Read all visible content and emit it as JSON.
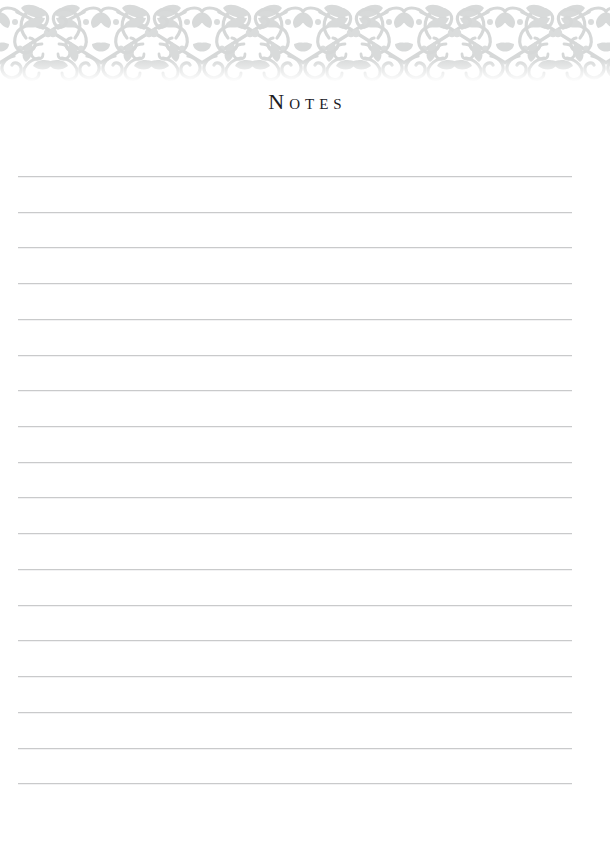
{
  "page": {
    "width": 610,
    "height": 859,
    "background_color": "#ffffff",
    "kind": "printable-notes-page"
  },
  "header": {
    "title": "Notes",
    "title_style": "small-caps-serif",
    "title_color": "#20201f",
    "ornament": {
      "name": "floral-vine-damask-border",
      "color": "#d5d7d7",
      "band_top": 0,
      "band_height": 82,
      "repeat_width": 101,
      "repeats": 6,
      "description": "Repeating scrollwork vine motif with paired leaves and spiral curls"
    }
  },
  "notes_area": {
    "line_color": "#c9cacb",
    "line_count": 18,
    "line_left": 18,
    "line_right": 572,
    "first_line_y": 176,
    "line_spacing": 35.7,
    "lines": [
      {
        "index": 1,
        "y": 176,
        "value": ""
      },
      {
        "index": 2,
        "y": 212,
        "value": ""
      },
      {
        "index": 3,
        "y": 247,
        "value": ""
      },
      {
        "index": 4,
        "y": 283,
        "value": ""
      },
      {
        "index": 5,
        "y": 319,
        "value": ""
      },
      {
        "index": 6,
        "y": 355,
        "value": ""
      },
      {
        "index": 7,
        "y": 390,
        "value": ""
      },
      {
        "index": 8,
        "y": 426,
        "value": ""
      },
      {
        "index": 9,
        "y": 462,
        "value": ""
      },
      {
        "index": 10,
        "y": 497,
        "value": ""
      },
      {
        "index": 11,
        "y": 533,
        "value": ""
      },
      {
        "index": 12,
        "y": 569,
        "value": ""
      },
      {
        "index": 13,
        "y": 605,
        "value": ""
      },
      {
        "index": 14,
        "y": 640,
        "value": ""
      },
      {
        "index": 15,
        "y": 676,
        "value": ""
      },
      {
        "index": 16,
        "y": 712,
        "value": ""
      },
      {
        "index": 17,
        "y": 748,
        "value": ""
      },
      {
        "index": 18,
        "y": 783,
        "value": ""
      }
    ]
  }
}
